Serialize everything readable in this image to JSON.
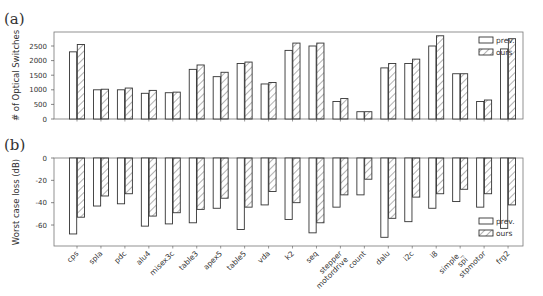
{
  "chart_data": [
    {
      "type": "bar",
      "panel_label": "(a)",
      "title": "",
      "xlabel": "",
      "ylabel": "# of Optical Switches",
      "ylim": [
        0,
        2900
      ],
      "yticks": [
        0,
        500,
        1000,
        1500,
        2000,
        2500
      ],
      "grid": false,
      "legend_position": "upper right",
      "categories": [
        "cps",
        "spla",
        "pdc",
        "alu4",
        "misex3c",
        "table3",
        "apex5",
        "table5",
        "vda",
        "k2",
        "seq",
        "stepper motordrive",
        "count",
        "dalu",
        "i2c",
        "i8",
        "simple_ spi",
        "stpmotor",
        "frg2"
      ],
      "series": [
        {
          "name": "prev.",
          "pattern": "none",
          "values": [
            2300,
            1000,
            1000,
            880,
            900,
            1700,
            1450,
            1900,
            1200,
            2350,
            2500,
            600,
            250,
            1750,
            1900,
            2500,
            1550,
            600,
            2400
          ]
        },
        {
          "name": "ours",
          "pattern": "hatch",
          "values": [
            2550,
            1020,
            1060,
            980,
            920,
            1850,
            1600,
            1950,
            1250,
            2600,
            2600,
            700,
            250,
            1900,
            2050,
            2850,
            1550,
            650,
            2750
          ]
        }
      ]
    },
    {
      "type": "bar",
      "panel_label": "(b)",
      "title": "",
      "xlabel": "",
      "ylabel": "Worst case loss (dB)",
      "ylim": [
        -79,
        0
      ],
      "yticks": [
        0,
        -20,
        -40,
        -60
      ],
      "grid": false,
      "legend_position": "lower right",
      "categories": [
        "cps",
        "spla",
        "pdc",
        "alu4",
        "misex3c",
        "table3",
        "apex5",
        "table5",
        "vda",
        "k2",
        "seq",
        "stepper motordrive",
        "count",
        "dalu",
        "i2c",
        "i8",
        "simple_ spi",
        "stpmotor",
        "frg2"
      ],
      "series": [
        {
          "name": "prev.",
          "pattern": "none",
          "values": [
            -68,
            -43,
            -41,
            -61,
            -59,
            -58,
            -45,
            -64,
            -42,
            -55,
            -67,
            -44,
            -33,
            -71,
            -57,
            -45,
            -39,
            -44,
            -63
          ]
        },
        {
          "name": "ours",
          "pattern": "hatch",
          "values": [
            -53,
            -34,
            -32,
            -52,
            -49,
            -46,
            -36,
            -44,
            -30,
            -40,
            -58,
            -33,
            -19,
            -54,
            -35,
            -32,
            -28,
            -32,
            -42
          ]
        }
      ]
    }
  ]
}
